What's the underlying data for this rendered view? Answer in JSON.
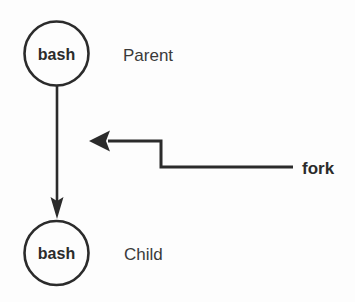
{
  "diagram": {
    "background_color": "#fdfdfd",
    "stroke_color": "#2b2b2b",
    "text_color": "#2b2b2b",
    "role_text_color": "#3a3a3a",
    "nodes": [
      {
        "id": "parent-process",
        "label": "bash",
        "role_label": "Parent",
        "cx": 56.5,
        "cy": 53.5,
        "r": 32
      },
      {
        "id": "child-process",
        "label": "bash",
        "role_label": "Child",
        "cx": 56.5,
        "cy": 253,
        "r": 32
      }
    ],
    "edges": [
      {
        "id": "parent-to-child",
        "from": "parent-process",
        "to": "child-process",
        "label": "",
        "arrow": "down"
      },
      {
        "id": "fork-callout",
        "label": "fork",
        "arrow": "left"
      }
    ],
    "callout": {
      "label": "fork",
      "x": 302,
      "y": 174
    }
  }
}
